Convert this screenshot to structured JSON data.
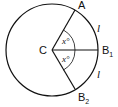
{
  "diagram": {
    "type": "circle-sectors",
    "labels": {
      "center": "C",
      "point_a": "A",
      "point_b1": "B",
      "point_b1_sub": "1",
      "point_b2": "B",
      "point_b2_sub": "2",
      "angle_upper": "x°",
      "angle_lower": "x°",
      "arc_upper": "l",
      "arc_lower": "l"
    },
    "colors": {
      "stroke": "#111111",
      "background": "#ffffff"
    }
  }
}
